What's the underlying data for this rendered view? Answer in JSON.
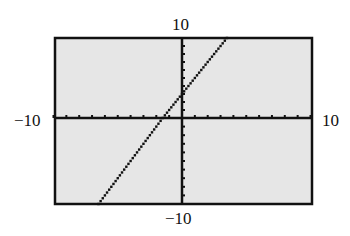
{
  "chart_data": {
    "type": "line",
    "title": "",
    "xlabel": "",
    "ylabel": "",
    "xlim": [
      -10,
      10
    ],
    "ylim": [
      -10,
      10
    ],
    "grid": false,
    "tick_labels": {
      "xmin": "−10",
      "xmax": "10",
      "ymin": "−10",
      "ymax": "10"
    },
    "series": [
      {
        "name": "y = 2x + 3",
        "x": [
          -6.5,
          -1.5,
          0,
          3.5
        ],
        "y": [
          -10,
          0,
          3,
          10
        ]
      }
    ],
    "x_ticks_step": 1,
    "y_ticks_step": 1,
    "background": "#e6e6e6"
  },
  "labels": {
    "ymax": "10",
    "ymin": "−10",
    "xmin": "−10",
    "xmax": "10"
  }
}
